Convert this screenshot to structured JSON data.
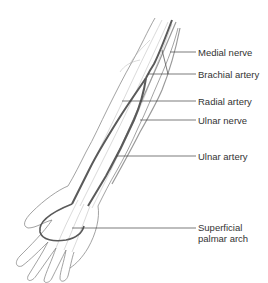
{
  "diagram": {
    "colors": {
      "background": "#ffffff",
      "outline": "#8a8a8a",
      "artery": "#5a5a5a",
      "nerve": "#9a9a9a",
      "leader_line": "#444444",
      "label_text": "#333333"
    },
    "labels": [
      {
        "id": "medial-nerve",
        "text": "Medial nerve",
        "x": 198,
        "y": 47
      },
      {
        "id": "brachial-artery",
        "text": "Brachial artery",
        "x": 198,
        "y": 69
      },
      {
        "id": "radial-artery",
        "text": "Radial artery",
        "x": 198,
        "y": 96
      },
      {
        "id": "ulnar-nerve",
        "text": "Ulnar nerve",
        "x": 198,
        "y": 117
      },
      {
        "id": "ulnar-artery",
        "text": "Ulnar artery",
        "x": 198,
        "y": 152
      },
      {
        "id": "superficial-palmar-arch-line1",
        "text": "Superficial",
        "x": 198,
        "y": 223
      },
      {
        "id": "superficial-palmar-arch-line2",
        "text": "palmar arch",
        "x": 198,
        "y": 235
      }
    ]
  }
}
